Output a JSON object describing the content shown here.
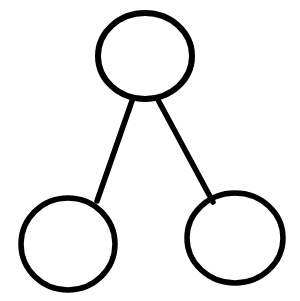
{
  "canvas": {
    "width": 300,
    "height": 301,
    "background_color": "#ffffff",
    "stroke_color": "#000000",
    "stroke_width": 5.5,
    "diagram_title": "Number Bond Diagram"
  },
  "diagram": {
    "type": "node-link",
    "nodes": [
      {
        "id": "top-node",
        "name": "top-circle",
        "label": "",
        "cx": 145,
        "cy": 56,
        "rx": 47,
        "ry": 43,
        "fill": "#ffffff",
        "stroke": "#000000",
        "stroke_width": 6
      },
      {
        "id": "bottom-left-node",
        "name": "bottom-left-circle",
        "label": "",
        "cx": 68,
        "cy": 244,
        "rx": 47,
        "ry": 46,
        "fill": "#ffffff",
        "stroke": "#000000",
        "stroke_width": 5.5
      },
      {
        "id": "bottom-right-node",
        "name": "bottom-right-circle",
        "label": "",
        "cx": 235,
        "cy": 238,
        "rx": 48,
        "ry": 45,
        "fill": "#ffffff",
        "stroke": "#000000",
        "stroke_width": 5.5
      }
    ],
    "edges": [
      {
        "id": "edge-top-to-bottom-left",
        "name": "connector-left",
        "from": "top-node",
        "to": "bottom-left-node",
        "x1": 133,
        "y1": 98,
        "x2": 97,
        "y2": 201,
        "stroke": "#000000",
        "stroke_width": 5.5
      },
      {
        "id": "edge-top-to-bottom-right",
        "name": "connector-right",
        "from": "top-node",
        "to": "bottom-right-node",
        "x1": 157,
        "y1": 98,
        "x2": 213,
        "y2": 202,
        "stroke": "#000000",
        "stroke_width": 5.5
      }
    ]
  }
}
